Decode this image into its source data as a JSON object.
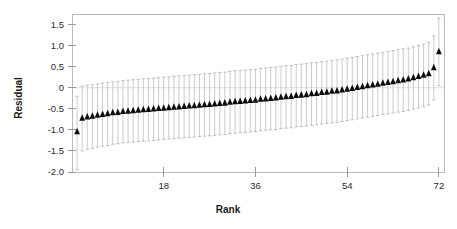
{
  "chart_data": {
    "type": "scatter",
    "title": "",
    "xlabel": "Rank",
    "ylabel": "Residual",
    "xlim": [
      0,
      73
    ],
    "ylim": [
      -2.0,
      1.75
    ],
    "grid": false,
    "legend": null,
    "marker_style": "filled-triangle-up",
    "marker_color": "#0d0d0d",
    "errorbar_color": "#c2c2c2",
    "errorbar_style": "capped-vertical",
    "xticks": [
      18,
      36,
      54,
      72
    ],
    "xtick_labels": [
      "18",
      "36",
      "54",
      "72"
    ],
    "yticks": [
      -2.0,
      -1.5,
      -1.0,
      -0.5,
      0,
      0.5,
      1.0,
      1.5
    ],
    "ytick_labels": [
      "-2.0",
      "-1.5",
      "-1.0",
      "-0.5",
      "0",
      "0.5",
      "1.0",
      "1.5"
    ],
    "x": [
      1,
      2,
      3,
      4,
      5,
      6,
      7,
      8,
      9,
      10,
      11,
      12,
      13,
      14,
      15,
      16,
      17,
      18,
      19,
      20,
      21,
      22,
      23,
      24,
      25,
      26,
      27,
      28,
      29,
      30,
      31,
      32,
      33,
      34,
      35,
      36,
      37,
      38,
      39,
      40,
      41,
      42,
      43,
      44,
      45,
      46,
      47,
      48,
      49,
      50,
      51,
      52,
      53,
      54,
      55,
      56,
      57,
      58,
      59,
      60,
      61,
      62,
      63,
      64,
      65,
      66,
      67,
      68,
      69,
      70,
      71,
      72
    ],
    "values": [
      -1.05,
      -0.73,
      -0.7,
      -0.68,
      -0.66,
      -0.64,
      -0.62,
      -0.6,
      -0.59,
      -0.57,
      -0.56,
      -0.55,
      -0.54,
      -0.53,
      -0.52,
      -0.51,
      -0.5,
      -0.49,
      -0.48,
      -0.47,
      -0.46,
      -0.45,
      -0.44,
      -0.43,
      -0.42,
      -0.41,
      -0.4,
      -0.39,
      -0.38,
      -0.37,
      -0.35,
      -0.34,
      -0.33,
      -0.32,
      -0.31,
      -0.3,
      -0.28,
      -0.27,
      -0.26,
      -0.25,
      -0.23,
      -0.22,
      -0.21,
      -0.19,
      -0.18,
      -0.17,
      -0.15,
      -0.14,
      -0.12,
      -0.11,
      -0.09,
      -0.08,
      -0.06,
      -0.04,
      -0.02,
      0.0,
      0.02,
      0.04,
      0.06,
      0.08,
      0.1,
      0.12,
      0.14,
      0.16,
      0.18,
      0.2,
      0.23,
      0.26,
      0.29,
      0.33,
      0.47,
      0.85
    ],
    "errors_upper": [
      0.85,
      0.77,
      0.76,
      0.76,
      0.75,
      0.75,
      0.75,
      0.74,
      0.74,
      0.74,
      0.74,
      0.74,
      0.74,
      0.74,
      0.74,
      0.74,
      0.74,
      0.74,
      0.74,
      0.74,
      0.74,
      0.74,
      0.74,
      0.74,
      0.74,
      0.74,
      0.74,
      0.74,
      0.74,
      0.74,
      0.74,
      0.74,
      0.74,
      0.74,
      0.74,
      0.74,
      0.74,
      0.74,
      0.74,
      0.74,
      0.74,
      0.74,
      0.74,
      0.74,
      0.74,
      0.74,
      0.74,
      0.74,
      0.74,
      0.74,
      0.74,
      0.74,
      0.74,
      0.74,
      0.74,
      0.74,
      0.74,
      0.74,
      0.74,
      0.74,
      0.74,
      0.74,
      0.74,
      0.74,
      0.74,
      0.74,
      0.74,
      0.74,
      0.74,
      0.74,
      0.76,
      0.8
    ],
    "errors_lower": [
      0.9,
      0.77,
      0.76,
      0.76,
      0.75,
      0.75,
      0.75,
      0.74,
      0.74,
      0.74,
      0.74,
      0.74,
      0.74,
      0.74,
      0.74,
      0.74,
      0.74,
      0.74,
      0.74,
      0.74,
      0.74,
      0.74,
      0.74,
      0.74,
      0.74,
      0.74,
      0.74,
      0.74,
      0.74,
      0.74,
      0.74,
      0.74,
      0.74,
      0.74,
      0.74,
      0.74,
      0.74,
      0.74,
      0.74,
      0.74,
      0.74,
      0.74,
      0.74,
      0.74,
      0.74,
      0.74,
      0.74,
      0.74,
      0.74,
      0.74,
      0.74,
      0.74,
      0.74,
      0.74,
      0.74,
      0.74,
      0.74,
      0.74,
      0.74,
      0.74,
      0.74,
      0.74,
      0.74,
      0.74,
      0.74,
      0.74,
      0.74,
      0.74,
      0.74,
      0.74,
      0.76,
      0.8
    ]
  }
}
